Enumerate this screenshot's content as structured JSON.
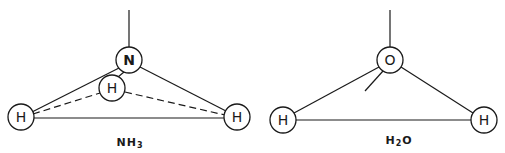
{
  "diagrams": [
    {
      "id": "nh3",
      "formula": {
        "main": "NH",
        "subscript": "3"
      },
      "atoms": {
        "central": {
          "label": "N",
          "x": 129,
          "y": 60
        },
        "back_h": {
          "label": "H",
          "x": 112,
          "y": 88
        },
        "left_h": {
          "label": "H",
          "x": 21,
          "y": 117
        },
        "right_h": {
          "label": "H",
          "x": 237,
          "y": 117
        }
      }
    },
    {
      "id": "h2o",
      "formula": {
        "main": "H",
        "subscript": "2",
        "tail": "O"
      },
      "atoms": {
        "central": {
          "label": "O",
          "x": 390,
          "y": 60
        },
        "left_h": {
          "label": "H",
          "x": 283,
          "y": 120
        },
        "right_h": {
          "label": "H",
          "x": 484,
          "y": 120
        }
      }
    }
  ],
  "colors": {
    "ink": "#1a1a1a",
    "background": "#ffffff"
  }
}
